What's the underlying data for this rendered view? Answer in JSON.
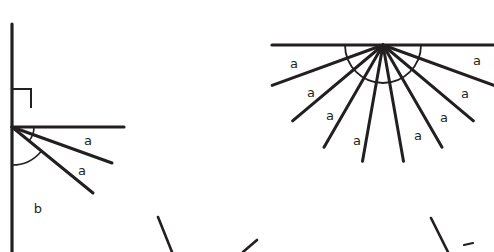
{
  "canvas": {
    "width": 494,
    "height": 252,
    "background": "#ffffff",
    "ink_color": "#231f20"
  },
  "figures": [
    {
      "id": "left-figure",
      "name": "right-angle-with-subdivided-angles",
      "vertex": {
        "x": 12,
        "y": 127
      },
      "vertical_line": {
        "x1": 12,
        "y1": 24,
        "x2": 12,
        "y2": 252,
        "width": 3.2
      },
      "horizontal_ray": {
        "x1": 12,
        "y1": 127,
        "x2": 124,
        "y2": 127,
        "width": 3.2
      },
      "rays": [
        {
          "name": "ray-upper",
          "x1": 12,
          "y1": 127,
          "x2": 112,
          "y2": 163,
          "width": 3.0
        },
        {
          "name": "ray-lower",
          "x1": 12,
          "y1": 127,
          "x2": 93,
          "y2": 193,
          "width": 3.0
        }
      ],
      "right_angle_marker": {
        "name": "right-angle-square",
        "x": 12,
        "y": 108,
        "size": 19,
        "width": 2.0
      },
      "arcs": [
        {
          "name": "small-arc",
          "cx": 12,
          "cy": 127,
          "r": 22,
          "start_deg": 0,
          "end_deg": 40,
          "width": 1.6
        },
        {
          "name": "large-arc",
          "cx": 12,
          "cy": 127,
          "r": 38,
          "start_deg": 40,
          "end_deg": 90,
          "width": 1.6
        }
      ],
      "labels": [
        {
          "name": "label-a-1",
          "text": "a",
          "x": 88,
          "y": 141
        },
        {
          "name": "label-a-2",
          "text": "a",
          "x": 82,
          "y": 171
        },
        {
          "name": "label-b-1",
          "text": "b",
          "x": 38,
          "y": 209
        }
      ]
    },
    {
      "id": "right-figure",
      "name": "straight-angle-divided-into-nine-equal-parts",
      "vertex": {
        "x": 383,
        "y": 45
      },
      "base_line": {
        "x1": 272,
        "y1": 45,
        "x2": 494,
        "y2": 45,
        "width": 3.2
      },
      "ray_count": 8,
      "sector_count": 9,
      "ray_length": 118,
      "ray_width": 3.0,
      "rays": [
        {
          "name": "fan-ray-1",
          "angle_deg": 20
        },
        {
          "name": "fan-ray-2",
          "angle_deg": 40
        },
        {
          "name": "fan-ray-3",
          "angle_deg": 60
        },
        {
          "name": "fan-ray-4",
          "angle_deg": 80
        },
        {
          "name": "fan-ray-5",
          "angle_deg": 100
        },
        {
          "name": "fan-ray-6",
          "angle_deg": 120
        },
        {
          "name": "fan-ray-7",
          "angle_deg": 140
        },
        {
          "name": "fan-ray-8",
          "angle_deg": 160
        }
      ],
      "arc": {
        "name": "straight-angle-arc",
        "cx": 383,
        "cy": 45,
        "r": 38,
        "start_deg": 0,
        "end_deg": 180,
        "width": 1.8
      },
      "labels": [
        {
          "name": "label-a-1",
          "text": "a",
          "x": 294,
          "y": 64
        },
        {
          "name": "label-a-2",
          "text": "a",
          "x": 311,
          "y": 93
        },
        {
          "name": "label-a-3",
          "text": "a",
          "x": 330,
          "y": 116
        },
        {
          "name": "label-a-4",
          "text": "a",
          "x": 357,
          "y": 141
        },
        {
          "name": "label-a-5",
          "text": "a",
          "x": 418,
          "y": 136
        },
        {
          "name": "label-a-6",
          "text": "a",
          "x": 444,
          "y": 118
        },
        {
          "name": "label-a-7",
          "text": "a",
          "x": 465,
          "y": 94
        },
        {
          "name": "label-a-8",
          "text": "a",
          "x": 477,
          "y": 61
        }
      ]
    },
    {
      "id": "bottom-cropped-figure-left",
      "name": "cropped-partial-lines-bottom-left",
      "segments": [
        {
          "name": "partial-ray-1",
          "x1": 158,
          "y1": 217,
          "x2": 172,
          "y2": 252,
          "width": 2.6
        },
        {
          "name": "partial-ray-2",
          "x1": 243,
          "y1": 252,
          "x2": 257,
          "y2": 240,
          "width": 2.6
        }
      ]
    },
    {
      "id": "bottom-cropped-figure-right",
      "name": "cropped-partial-lines-bottom-right",
      "segments": [
        {
          "name": "partial-ray-3",
          "x1": 431,
          "y1": 218,
          "x2": 448,
          "y2": 252,
          "width": 2.6
        },
        {
          "name": "partial-ray-4",
          "x1": 464,
          "y1": 245,
          "x2": 473,
          "y2": 243,
          "width": 2.2
        }
      ]
    }
  ]
}
